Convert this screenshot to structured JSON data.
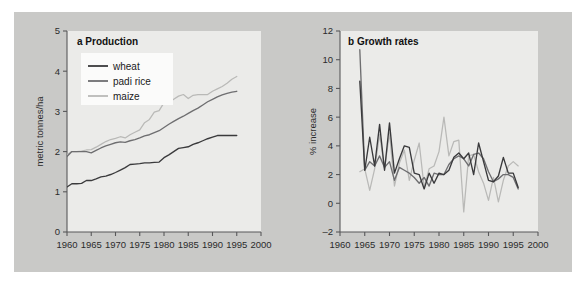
{
  "figure": {
    "background_color": "#c9c9c7",
    "plot_background_color": "#ebebe9",
    "panels": [
      {
        "id": "a",
        "title": "a Production"
      },
      {
        "id": "b",
        "title": "b Growth rates"
      }
    ]
  },
  "colors": {
    "wheat": "#3a3a3c",
    "padi_rice": "#6e6e70",
    "maize": "#b9b9b7",
    "axis": "#58585a",
    "text": "#2b2b2b"
  },
  "legend": {
    "position": "top-left",
    "items": [
      {
        "label": "wheat",
        "color": "#3a3a3c"
      },
      {
        "label": "padi rice",
        "color": "#6e6e70"
      },
      {
        "label": "maize",
        "color": "#b9b9b7"
      }
    ]
  },
  "chart_data": [
    {
      "type": "line",
      "title": "a Production",
      "xlabel": "",
      "ylabel": "metric tonnes/ha",
      "xlim": [
        1960,
        2000
      ],
      "ylim": [
        0,
        5
      ],
      "xticks": [
        1960,
        1965,
        1970,
        1975,
        1980,
        1985,
        1990,
        1995,
        2000
      ],
      "yticks": [
        0,
        1,
        2,
        3,
        4,
        5
      ],
      "grid": false,
      "legend_position": "top-left",
      "x": [
        1960,
        1961,
        1962,
        1963,
        1964,
        1965,
        1966,
        1967,
        1968,
        1969,
        1970,
        1971,
        1972,
        1973,
        1974,
        1975,
        1976,
        1977,
        1978,
        1979,
        1980,
        1981,
        1982,
        1983,
        1984,
        1985,
        1986,
        1987,
        1988,
        1989,
        1990,
        1991,
        1992,
        1993,
        1994,
        1995
      ],
      "series": [
        {
          "name": "wheat",
          "color": "#3a3a3c",
          "values": [
            1.12,
            1.2,
            1.2,
            1.21,
            1.28,
            1.28,
            1.32,
            1.37,
            1.39,
            1.43,
            1.48,
            1.54,
            1.6,
            1.68,
            1.69,
            1.7,
            1.72,
            1.72,
            1.73,
            1.74,
            1.85,
            1.92,
            2.0,
            2.08,
            2.1,
            2.12,
            2.18,
            2.22,
            2.27,
            2.32,
            2.36,
            2.4,
            2.4,
            2.4,
            2.4,
            2.4
          ]
        },
        {
          "name": "padi rice",
          "color": "#6e6e70",
          "values": [
            1.88,
            2.0,
            2.0,
            2.0,
            2.0,
            1.97,
            2.03,
            2.09,
            2.14,
            2.18,
            2.22,
            2.24,
            2.23,
            2.27,
            2.3,
            2.34,
            2.39,
            2.42,
            2.47,
            2.52,
            2.6,
            2.68,
            2.75,
            2.82,
            2.88,
            2.95,
            3.02,
            3.08,
            3.16,
            3.24,
            3.3,
            3.36,
            3.41,
            3.45,
            3.48,
            3.5
          ]
        },
        {
          "name": "maize",
          "color": "#b9b9b7",
          "values": [
            1.92,
            2.0,
            2.0,
            2.01,
            2.04,
            2.05,
            2.11,
            2.18,
            2.25,
            2.3,
            2.33,
            2.37,
            2.34,
            2.42,
            2.48,
            2.54,
            2.72,
            2.8,
            2.98,
            3.02,
            3.22,
            3.22,
            3.3,
            3.38,
            3.42,
            3.32,
            3.4,
            3.42,
            3.42,
            3.42,
            3.5,
            3.56,
            3.62,
            3.7,
            3.8,
            3.87
          ]
        }
      ]
    },
    {
      "type": "line",
      "title": "b Growth rates",
      "xlabel": "",
      "ylabel": "% increase",
      "xlim": [
        1960,
        2000
      ],
      "ylim": [
        -2,
        12
      ],
      "xticks": [
        1960,
        1965,
        1970,
        1975,
        1980,
        1985,
        1990,
        1995,
        2000
      ],
      "yticks": [
        -2,
        0,
        2,
        4,
        6,
        8,
        10,
        12
      ],
      "grid": false,
      "legend_position": "none",
      "x": [
        1964,
        1965,
        1966,
        1967,
        1968,
        1969,
        1970,
        1971,
        1972,
        1973,
        1974,
        1975,
        1976,
        1977,
        1978,
        1979,
        1980,
        1981,
        1982,
        1983,
        1984,
        1985,
        1986,
        1987,
        1988,
        1989,
        1990,
        1991,
        1992,
        1993,
        1994,
        1995,
        1996
      ],
      "series": [
        {
          "name": "wheat",
          "color": "#3a3a3c",
          "values": [
            8.5,
            2.3,
            4.6,
            2.6,
            5.5,
            2.3,
            5.6,
            2.1,
            3.1,
            4.0,
            3.9,
            2.1,
            2.0,
            1.0,
            2.1,
            1.4,
            2.1,
            2.0,
            2.3,
            3.2,
            3.5,
            3.1,
            3.5,
            2.0,
            4.2,
            2.9,
            1.6,
            1.5,
            1.9,
            3.2,
            2.1,
            2.1,
            1.1
          ]
        },
        {
          "name": "padi rice",
          "color": "#6e6e70",
          "values": [
            10.7,
            2.3,
            2.9,
            2.6,
            3.3,
            2.5,
            2.9,
            1.6,
            2.5,
            2.3,
            2.1,
            1.8,
            1.4,
            1.8,
            1.2,
            2.1,
            2.0,
            2.0,
            2.7,
            3.1,
            3.3,
            3.1,
            2.6,
            3.4,
            3.5,
            3.1,
            2.2,
            1.5,
            1.7,
            2.0,
            2.0,
            1.8,
            1.0
          ]
        },
        {
          "name": "maize",
          "color": "#b9b9b7",
          "values": [
            2.2,
            2.4,
            0.9,
            2.4,
            4.8,
            2.4,
            4.9,
            1.2,
            2.8,
            3.7,
            1.6,
            3.0,
            4.2,
            1.1,
            2.4,
            2.6,
            3.6,
            6.0,
            3.3,
            4.3,
            4.4,
            -0.6,
            3.3,
            3.4,
            2.2,
            1.4,
            0.2,
            1.8,
            0.1,
            1.6,
            2.6,
            2.9,
            2.6
          ]
        }
      ]
    }
  ]
}
